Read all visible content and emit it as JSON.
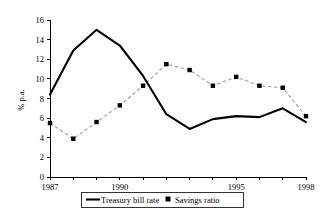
{
  "chart_data": {
    "type": "line",
    "title": "",
    "subtitle": "",
    "xlabel": "",
    "ylabel": "% p.a.",
    "x": [
      1987,
      1988,
      1989,
      1990,
      1991,
      1992,
      1993,
      1994,
      1995,
      1996,
      1997,
      1998
    ],
    "xlim": [
      1987,
      1998
    ],
    "ylim": [
      0,
      16
    ],
    "yticks": [
      0,
      2,
      4,
      6,
      8,
      10,
      12,
      14,
      16
    ],
    "ytick_labels": [
      "0",
      "2",
      "4",
      "6",
      "8",
      "10",
      "12",
      "14",
      "16"
    ],
    "xticks": [
      1987,
      1988,
      1989,
      1990,
      1991,
      1992,
      1993,
      1994,
      1995,
      1996,
      1997,
      1998
    ],
    "xtick_labels": [
      "1987",
      "",
      "",
      "1990",
      "",
      "",
      "",
      "",
      "1995",
      "",
      "",
      "1998"
    ],
    "grid": false,
    "legend_position": "bottom",
    "series": [
      {
        "name": "Treasury bill rate",
        "style": "solid",
        "color": "#000000",
        "marker": "none",
        "values": [
          8.4,
          12.9,
          15.0,
          13.4,
          10.3,
          6.4,
          4.9,
          5.9,
          6.2,
          6.1,
          7.0,
          5.6
        ]
      },
      {
        "name": "Savings ratio",
        "style": "dashed",
        "color": "#9a9a9a",
        "marker": "square",
        "values": [
          5.5,
          3.9,
          5.6,
          7.3,
          9.3,
          11.5,
          10.9,
          9.3,
          10.2,
          9.3,
          9.1,
          6.2
        ]
      }
    ]
  },
  "legend": {
    "items": [
      {
        "label": "Treasury bill rate",
        "symbol": "line"
      },
      {
        "label": "Savings ratio",
        "symbol": "square"
      }
    ]
  }
}
